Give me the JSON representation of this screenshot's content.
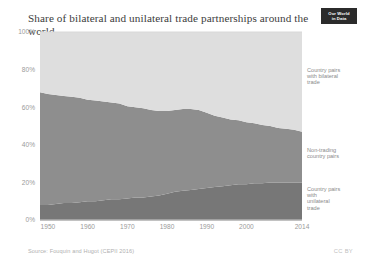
{
  "header": {
    "title": "Share of bilateral and unilateral trade partnerships around the world",
    "logo_line1": "Our World",
    "logo_line2": "in Data"
  },
  "footer": {
    "source": "Source: Fouquin and Hugot (CEPII 2016)",
    "license": "CC BY"
  },
  "legend": {
    "bilateral": "Country pairs with bilateral trade",
    "nontrading": "Non-trading country pairs",
    "unilateral": "Country pairs with unilateral trade"
  },
  "colors": {
    "bilateral": "#dedede",
    "nontrading": "#8e8e8e",
    "unilateral": "#777777",
    "axis": "#9a9a9a",
    "grid": "#d8d8d8",
    "title": "#3c3c3c"
  },
  "chart_data": {
    "type": "area",
    "stacked": true,
    "title": "Share of bilateral and unilateral trade partnerships around the world",
    "xlabel": "",
    "ylabel": "",
    "xlim": [
      1948,
      2014
    ],
    "ylim": [
      0,
      100
    ],
    "ytick_labels": [
      "0%",
      "20%",
      "40%",
      "60%",
      "80%",
      "100%"
    ],
    "yticks": [
      0,
      20,
      40,
      60,
      80,
      100
    ],
    "xticks": [
      1950,
      1960,
      1970,
      1980,
      1990,
      2000,
      2014
    ],
    "xtick_labels": [
      "1950",
      "1960",
      "1970",
      "1980",
      "1990",
      "2000",
      "2014"
    ],
    "grid": false,
    "legend_position": "inline-right",
    "x": [
      1948,
      1950,
      1952,
      1954,
      1956,
      1958,
      1960,
      1962,
      1964,
      1966,
      1968,
      1970,
      1972,
      1974,
      1976,
      1978,
      1980,
      1982,
      1984,
      1986,
      1988,
      1990,
      1992,
      1994,
      1996,
      1998,
      2000,
      2002,
      2004,
      2006,
      2008,
      2010,
      2012,
      2014
    ],
    "series": [
      {
        "name": "Country pairs with unilateral trade",
        "color": "#777777",
        "values": [
          8,
          8,
          8.5,
          9,
          9,
          9.5,
          10,
          10,
          10.5,
          11,
          11,
          11.5,
          12,
          12,
          12.5,
          13,
          14,
          15,
          15.5,
          16,
          16.5,
          17,
          17.5,
          18,
          18.5,
          19,
          19,
          19.5,
          19.5,
          20,
          20,
          20,
          20,
          20
        ]
      },
      {
        "name": "Non-trading country pairs",
        "color": "#8e8e8e",
        "values": [
          60,
          59,
          58,
          57,
          56.5,
          55.5,
          54,
          53.5,
          52.5,
          51.5,
          51,
          49,
          48,
          47.5,
          46,
          45,
          44,
          43.5,
          43.5,
          43,
          42,
          40,
          38,
          36.5,
          35,
          34,
          33,
          32,
          31,
          30,
          29,
          28.5,
          28,
          27
        ]
      },
      {
        "name": "Country pairs with bilateral trade",
        "color": "#dedede",
        "values": [
          32,
          33,
          33.5,
          34,
          34.5,
          35,
          36,
          36.5,
          37,
          37.5,
          38,
          39.5,
          40,
          40.5,
          41.5,
          42,
          42,
          41.5,
          41,
          41,
          41.5,
          43,
          44.5,
          45.5,
          46.5,
          47,
          48,
          48.5,
          49.5,
          50,
          51,
          51.5,
          52,
          53
        ]
      }
    ]
  }
}
